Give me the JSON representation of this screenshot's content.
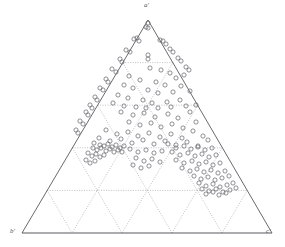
{
  "figure": {
    "type": "ternary-scatter-diagram",
    "background_color": "#ffffff",
    "axis_color": "#5a585e",
    "grid_color": "#8d8b92",
    "marker_color": "#6b6970",
    "marker_shape": "open-circle",
    "marker_radius_px": 2.1,
    "width_px": 285,
    "height_px": 247
  },
  "vertices": {
    "top": {
      "label": "a'",
      "x": 148,
      "y": 20
    },
    "bottom_left": {
      "label": "b'",
      "x": 22,
      "y": 233
    },
    "bottom_right": {
      "label": "c'",
      "x": 272,
      "y": 233
    }
  },
  "grid": {
    "divisions": 5,
    "style": "dotted",
    "directions": [
      "horizontal",
      "left-leaning",
      "right-leaning"
    ],
    "horizontal_line_y": [
      63,
      106,
      149,
      191
    ],
    "outline_style": "solid"
  },
  "chart_data": {
    "type": "scatter",
    "coordinate_system": "ternary",
    "title": "",
    "xlabel": "",
    "ylabel": "",
    "axes": [
      {
        "name": "a'",
        "vertex": "top"
      },
      {
        "name": "b'",
        "vertex": "bottom-left"
      },
      {
        "name": "c'",
        "vertex": "bottom-right"
      }
    ],
    "series": [
      {
        "name": "samples",
        "marker": "open-circle",
        "color": "#6b6970",
        "points_px": [
          [
            148,
            23
          ],
          [
            148,
            28
          ],
          [
            146,
            27
          ],
          [
            134,
            39
          ],
          [
            137,
            38
          ],
          [
            139,
            41
          ],
          [
            160,
            40
          ],
          [
            163,
            41
          ],
          [
            166,
            44
          ],
          [
            126,
            50
          ],
          [
            130,
            52
          ],
          [
            170,
            49
          ],
          [
            173,
            52
          ],
          [
            148,
            55
          ],
          [
            148,
            59
          ],
          [
            120,
            59
          ],
          [
            122,
            62
          ],
          [
            178,
            58
          ],
          [
            181,
            61
          ],
          [
            112,
            69
          ],
          [
            116,
            72
          ],
          [
            186,
            67
          ],
          [
            189,
            70
          ],
          [
            106,
            79
          ],
          [
            108,
            82
          ],
          [
            100,
            88
          ],
          [
            103,
            90
          ],
          [
            95,
            97
          ],
          [
            97,
            100
          ],
          [
            90,
            105
          ],
          [
            92,
            108
          ],
          [
            86,
            112
          ],
          [
            88,
            115
          ],
          [
            80,
            121
          ],
          [
            83,
            124
          ],
          [
            76,
            130
          ],
          [
            78,
            133
          ],
          [
            150,
            68
          ],
          [
            161,
            70
          ],
          [
            170,
            73
          ],
          [
            176,
            78
          ],
          [
            184,
            75
          ],
          [
            129,
            76
          ],
          [
            140,
            80
          ],
          [
            156,
            82
          ],
          [
            165,
            85
          ],
          [
            181,
            86
          ],
          [
            124,
            85
          ],
          [
            133,
            88
          ],
          [
            148,
            90
          ],
          [
            158,
            93
          ],
          [
            173,
            92
          ],
          [
            190,
            91
          ],
          [
            118,
            95
          ],
          [
            128,
            98
          ],
          [
            143,
            100
          ],
          [
            152,
            103
          ],
          [
            167,
            102
          ],
          [
            180,
            100
          ],
          [
            113,
            103
          ],
          [
            124,
            106
          ],
          [
            136,
            107
          ],
          [
            146,
            108
          ],
          [
            158,
            108
          ],
          [
            171,
            107
          ],
          [
            186,
            106
          ],
          [
            196,
            105
          ],
          [
            121,
            112
          ],
          [
            133,
            115
          ],
          [
            144,
            113
          ],
          [
            155,
            117
          ],
          [
            168,
            114
          ],
          [
            178,
            118
          ],
          [
            190,
            112
          ],
          [
            129,
            122
          ],
          [
            140,
            125
          ],
          [
            151,
            123
          ],
          [
            161,
            127
          ],
          [
            172,
            124
          ],
          [
            183,
            128
          ],
          [
            196,
            122
          ],
          [
            106,
            130
          ],
          [
            117,
            134
          ],
          [
            128,
            132
          ],
          [
            138,
            136
          ],
          [
            149,
            133
          ],
          [
            160,
            137
          ],
          [
            171,
            134
          ],
          [
            182,
            138
          ],
          [
            193,
            131
          ],
          [
            203,
            136
          ],
          [
            99,
            138
          ],
          [
            110,
            141
          ],
          [
            121,
            139
          ],
          [
            132,
            143
          ],
          [
            143,
            140
          ],
          [
            154,
            144
          ],
          [
            165,
            141
          ],
          [
            176,
            145
          ],
          [
            187,
            142
          ],
          [
            198,
            146
          ],
          [
            208,
            140
          ],
          [
            94,
            143
          ],
          [
            100,
            145
          ],
          [
            104,
            146
          ],
          [
            108,
            144
          ],
          [
            112,
            147
          ],
          [
            116,
            145
          ],
          [
            120,
            148
          ],
          [
            124,
            146
          ],
          [
            93,
            148
          ],
          [
            97,
            150
          ],
          [
            101,
            148
          ],
          [
            106,
            151
          ],
          [
            110,
            149
          ],
          [
            114,
            152
          ],
          [
            118,
            150
          ],
          [
            122,
            152
          ],
          [
            88,
            153
          ],
          [
            92,
            156
          ],
          [
            96,
            154
          ],
          [
            100,
            157
          ],
          [
            104,
            155
          ],
          [
            86,
            160
          ],
          [
            90,
            163
          ],
          [
            95,
            161
          ],
          [
            130,
            149
          ],
          [
            138,
            152
          ],
          [
            146,
            150
          ],
          [
            154,
            153
          ],
          [
            162,
            151
          ],
          [
            136,
            158
          ],
          [
            144,
            161
          ],
          [
            152,
            159
          ],
          [
            160,
            162
          ],
          [
            133,
            165
          ],
          [
            141,
            168
          ],
          [
            149,
            166
          ],
          [
            168,
            144
          ],
          [
            176,
            148
          ],
          [
            184,
            146
          ],
          [
            191,
            149
          ],
          [
            198,
            147
          ],
          [
            205,
            150
          ],
          [
            212,
            148
          ],
          [
            172,
            152
          ],
          [
            180,
            155
          ],
          [
            188,
            153
          ],
          [
            195,
            156
          ],
          [
            202,
            154
          ],
          [
            209,
            157
          ],
          [
            216,
            155
          ],
          [
            176,
            160
          ],
          [
            184,
            163
          ],
          [
            192,
            161
          ],
          [
            199,
            164
          ],
          [
            206,
            162
          ],
          [
            213,
            165
          ],
          [
            220,
            163
          ],
          [
            182,
            168
          ],
          [
            190,
            171
          ],
          [
            197,
            169
          ],
          [
            204,
            172
          ],
          [
            211,
            170
          ],
          [
            218,
            173
          ],
          [
            225,
            171
          ],
          [
            194,
            176
          ],
          [
            201,
            179
          ],
          [
            208,
            177
          ],
          [
            215,
            180
          ],
          [
            222,
            178
          ],
          [
            229,
            176
          ],
          [
            199,
            183
          ],
          [
            206,
            186
          ],
          [
            213,
            184
          ],
          [
            220,
            187
          ],
          [
            227,
            185
          ],
          [
            233,
            183
          ],
          [
            202,
            189
          ],
          [
            209,
            191
          ],
          [
            216,
            189
          ],
          [
            223,
            192
          ],
          [
            230,
            190
          ],
          [
            236,
            188
          ],
          [
            206,
            194
          ],
          [
            213,
            192
          ],
          [
            219,
            195
          ],
          [
            226,
            193
          ]
        ],
        "n_points": 178
      }
    ],
    "markers_on_left_edge": true,
    "markers_on_right_edge": true,
    "legend": null,
    "annotations": []
  }
}
